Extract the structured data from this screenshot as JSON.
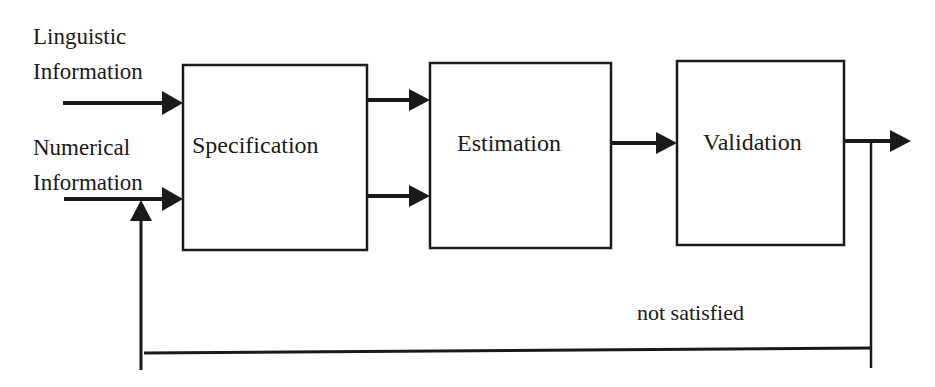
{
  "diagram": {
    "inputs": [
      {
        "line1": "Linguistic",
        "line2": "Information"
      },
      {
        "line1": "Numerical",
        "line2": "Information"
      }
    ],
    "boxes": [
      {
        "id": "specification",
        "label": "Specification"
      },
      {
        "id": "estimation",
        "label": "Estimation"
      },
      {
        "id": "validation",
        "label": "Validation"
      }
    ],
    "feedback_label": "not satisfied",
    "colors": {
      "stroke": "#1a1a1a",
      "background": "#ffffff"
    }
  }
}
